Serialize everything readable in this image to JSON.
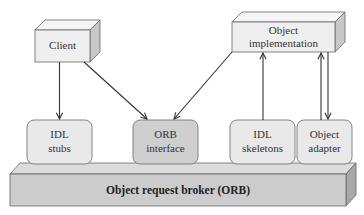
{
  "diagram": {
    "type": "architecture",
    "nodes": {
      "client": {
        "label_lines": [
          "Client"
        ],
        "shape": "3d-box",
        "fill": "#efefef"
      },
      "object_implementation": {
        "label_lines": [
          "Object",
          "implementation"
        ],
        "shape": "3d-box",
        "fill": "#efefef"
      },
      "idl_stubs": {
        "label_lines": [
          "IDL",
          "stubs"
        ],
        "shape": "rounded-rect",
        "fill": "#e9e9e9"
      },
      "orb_interface": {
        "label_lines": [
          "ORB",
          "interface"
        ],
        "shape": "rounded-rect",
        "fill": "#cfcfcf"
      },
      "idl_skeletons": {
        "label_lines": [
          "IDL",
          "skeletons"
        ],
        "shape": "rounded-rect",
        "fill": "#e9e9e9"
      },
      "object_adapter": {
        "label_lines": [
          "Object",
          "adapter"
        ],
        "shape": "rounded-rect",
        "fill": "#e9e9e9"
      },
      "orb": {
        "label": "Object request broker (ORB)",
        "shape": "3d-bar",
        "fill": "#cccccc"
      }
    },
    "edges": [
      {
        "from": "client",
        "to": "idl_stubs",
        "direction": "down"
      },
      {
        "from": "client",
        "to": "orb_interface",
        "direction": "diagonal"
      },
      {
        "from": "object_implementation",
        "to": "orb_interface",
        "direction": "diagonal"
      },
      {
        "from": "idl_skeletons",
        "to": "object_implementation",
        "direction": "up"
      },
      {
        "from": "object_adapter",
        "to": "object_implementation",
        "direction": "up"
      },
      {
        "from": "object_implementation",
        "to": "object_adapter",
        "direction": "down"
      }
    ],
    "colors": {
      "stroke": "#555555",
      "box_front": "#efefef",
      "box_top": "#f6f6f6",
      "box_side": "#c8c8c8",
      "orb_front": "#cccccc",
      "orb_top": "#dcdcdc",
      "orb_side": "#a8a8a8"
    }
  }
}
